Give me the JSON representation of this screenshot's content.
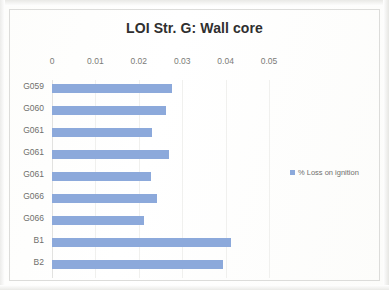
{
  "chart_data": {
    "type": "bar",
    "orientation": "horizontal",
    "title": "LOI Str. G: Wall core",
    "xlabel": "",
    "ylabel": "",
    "categories": [
      "G059",
      "G060",
      "G061",
      "G061",
      "G061",
      "G066",
      "G066",
      "B1",
      "B2"
    ],
    "series": [
      {
        "name": "% Loss on ignition",
        "color": "#8CA9DB",
        "values": [
          0.0277,
          0.0263,
          0.023,
          0.027,
          0.0228,
          0.0242,
          0.0212,
          0.0412,
          0.0394
        ]
      }
    ],
    "xlim": [
      0,
      0.05
    ],
    "xticks": [
      0,
      0.01,
      0.02,
      0.03,
      0.04,
      0.05
    ],
    "xtick_labels": [
      "0",
      "0.01",
      "0.02",
      "0.03",
      "0.04",
      "0.05"
    ],
    "grid": false,
    "legend": {
      "position": "right",
      "entries": [
        {
          "label": "% Loss on ignition",
          "color": "#8CA9DB",
          "marker": "square"
        }
      ]
    }
  }
}
